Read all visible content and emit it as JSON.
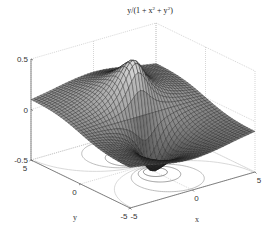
{
  "chart_data": {
    "type": "surface3d",
    "title_parts": {
      "prefix": "y/(1 + x",
      "sup1": "2",
      "mid": " + y",
      "sup2": "2",
      "suffix": ")"
    },
    "function": "z = y / (1 + x^2 + y^2)",
    "xlabel": "x",
    "ylabel": "y",
    "zlabel": "",
    "xlim": [
      -5,
      5
    ],
    "ylim": [
      -5,
      5
    ],
    "zlim": [
      -0.5,
      0.5
    ],
    "x_ticks": [
      -5,
      0,
      5
    ],
    "y_ticks": [
      -5,
      0,
      5
    ],
    "z_ticks": [
      -0.5,
      0,
      0.5
    ],
    "x_tick_labels": [
      "-5",
      "0",
      "5"
    ],
    "y_tick_labels": [
      "-5",
      "0",
      "5"
    ],
    "z_tick_labels": [
      "-0.5",
      "0",
      "0.5"
    ],
    "grid": true,
    "mesh_resolution": 41,
    "contour_levels": [
      -0.4,
      -0.3,
      -0.2,
      -0.1,
      0.1,
      0.2,
      0.3,
      0.4
    ],
    "contour_on_floor": true,
    "colormap": "gray",
    "z_peak": {
      "x": 0,
      "y": 1,
      "z": 0.5
    },
    "z_trough": {
      "x": 0,
      "y": -1,
      "z": -0.5
    }
  },
  "colors": {
    "background": "#ffffff",
    "axis": "#555555",
    "grid": "#bbbbbb",
    "mesh_edge": "#1a1a1a"
  }
}
